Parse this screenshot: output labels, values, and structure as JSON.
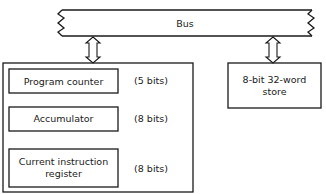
{
  "bus": {
    "label": "Bus"
  },
  "processor": {
    "registers": [
      {
        "name": "Program counter",
        "width": "(5 bits)"
      },
      {
        "name": "Accumulator",
        "width": "(8 bits)"
      },
      {
        "name": "Current instruction register",
        "line1": "Current instruction",
        "line2": "register",
        "width": "(8 bits)"
      }
    ]
  },
  "store": {
    "line1": "8-bit 32-word",
    "line2": "store"
  },
  "colors": {
    "line": "#1a1a1a",
    "background": "#ffffff"
  }
}
